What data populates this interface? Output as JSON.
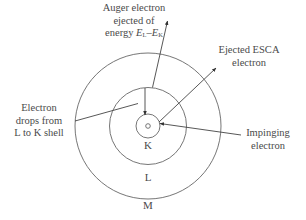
{
  "diagram": {
    "type": "atomic shell diagram - Auger / ESCA process",
    "shells": [
      {
        "id": "K",
        "label": "K"
      },
      {
        "id": "L",
        "label": "L"
      },
      {
        "id": "M",
        "label": "M"
      }
    ],
    "labels": {
      "auger_line1": "Auger electron",
      "auger_line2": "ejected of",
      "auger_line3_prefix": "energy ",
      "auger_E1": "E",
      "auger_E1_sub": "L",
      "auger_dash": "–",
      "auger_E2": "E",
      "auger_E2_sub": "K",
      "esca_line1": "Ejected ESCA",
      "esca_line2": "electron",
      "drop_line1": "Electron",
      "drop_line2": "drops from",
      "drop_line3": "L to K shell",
      "impinging_line1": "Impinging",
      "impinging_line2": "electron"
    },
    "colors": {
      "line": "#555555",
      "text": "#4a4a4a",
      "background": "#ffffff"
    }
  }
}
